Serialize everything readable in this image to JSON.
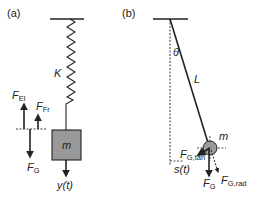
{
  "panels": {
    "a": {
      "label": "(a)",
      "spring_label": "K",
      "mass_label": "m",
      "displacement_label": "y(t)",
      "forces": {
        "elastic": {
          "symbol": "F",
          "sub": "El"
        },
        "friction": {
          "symbol": "F",
          "sub": "Fr"
        },
        "gravity": {
          "symbol": "F",
          "sub": "G"
        }
      }
    },
    "b": {
      "label": "(b)",
      "angle_label": "θ",
      "length_label": "L",
      "mass_label": "m",
      "arc_label": "s(t)",
      "forces": {
        "gravity": {
          "symbol": "F",
          "sub": "G"
        },
        "tangential": {
          "symbol": "F",
          "sub": "G,tan"
        },
        "radial": {
          "symbol": "F",
          "sub": "G,rad"
        }
      }
    }
  },
  "colors": {
    "ink": "#222222",
    "mass_fill": "#999999",
    "bob_fill": "#9a9a9a",
    "background": "#ffffff"
  }
}
